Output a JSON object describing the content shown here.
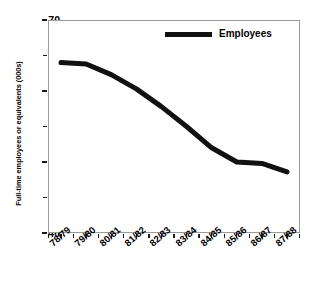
{
  "chart_data": {
    "type": "line",
    "title": "",
    "subtitle": "",
    "xlabel": "",
    "ylabel": "Full-time employees or equivalents (000s)",
    "categories": [
      "78/79",
      "79/80",
      "80/81",
      "81/82",
      "82/83",
      "83/84",
      "84/85",
      "85/86",
      "86/87",
      "87/88"
    ],
    "series": [
      {
        "name": "Employees",
        "color": "#111111",
        "values": [
          64.0,
          63.8,
          62.3,
          60.3,
          57.8,
          55.0,
          52.0,
          50.0,
          49.8,
          48.6
        ]
      }
    ],
    "ylim": [
      40,
      70
    ],
    "y_major_ticks": [
      70,
      60,
      50,
      40
    ],
    "y_minor_ticks": [
      65,
      55,
      45
    ],
    "y_tick_labels": [
      "70",
      "60",
      "50",
      "40"
    ],
    "grid": false,
    "legend_position": "top-center",
    "line_width_px": 5
  },
  "legend": {
    "entries": [
      {
        "label": "Employees",
        "color": "#111111"
      }
    ]
  },
  "axes": {
    "y_title": "Full-time employees or equivalents (000s)",
    "y_labels": [
      "70",
      "60",
      "50",
      "40"
    ],
    "x_labels": [
      "78/79",
      "79/80",
      "80/81",
      "81/82",
      "82/83",
      "83/84",
      "84/85",
      "85/86",
      "86/87",
      "87/88"
    ]
  }
}
